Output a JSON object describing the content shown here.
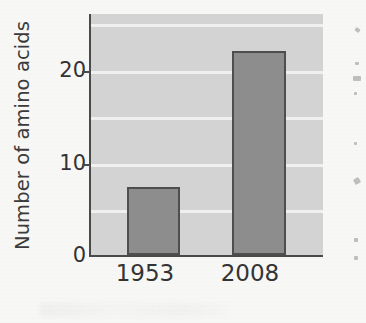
{
  "chart_data": {
    "type": "bar",
    "title": "",
    "subtitle": "",
    "xlabel": "",
    "ylabel": "Number of amino acids",
    "categories": [
      "1953",
      "2008"
    ],
    "values": [
      7.3,
      22
    ],
    "series": [
      {
        "name": "Number of amino acids",
        "values": [
          7.3,
          22
        ]
      }
    ],
    "ylim": [
      0,
      26
    ],
    "yticks": [
      0,
      10,
      20
    ],
    "ytick_labels": [
      "0",
      "10",
      "20"
    ],
    "grid": true,
    "grid_orientation": "horizontal",
    "legend": false,
    "legend_position": "none",
    "bar_fill_color": "#8d8d8d",
    "bar_edge_color": "#4e4e4e",
    "plot_background_color": "#d2d3d2",
    "gridline_color": "#f2f2f0",
    "axis_color": "#4a4a4a",
    "figure_background_color": "#f7f7f6",
    "text_color": "#333333",
    "annotations": []
  },
  "axes": {
    "y_title": "Number of amino acids",
    "y_tick_0": "0",
    "y_tick_10": "10",
    "y_tick_20": "20",
    "x_tick_1": "1953",
    "x_tick_2": "2008"
  }
}
